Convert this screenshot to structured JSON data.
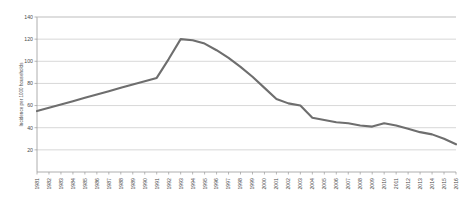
{
  "chart_data": {
    "type": "line",
    "title": "",
    "xlabel": "",
    "ylabel": "Incidence per 1000 households",
    "ylim": [
      0,
      140
    ],
    "yticks": [
      20,
      40,
      60,
      80,
      100,
      120,
      140
    ],
    "xlim": [
      1981,
      2016
    ],
    "grid": "horizontal",
    "legend": "none",
    "line_color": "#6e6e6e",
    "gridline_color": "#c6c6c6",
    "axis_color": "#9a9a9a",
    "categories": [
      "1981",
      "1982",
      "1983",
      "1984",
      "1985",
      "1986",
      "1987",
      "1988",
      "1989",
      "1990",
      "1991",
      "1992",
      "1993",
      "1994",
      "1995",
      "1996",
      "1997",
      "1998",
      "1999",
      "2000",
      "2001",
      "2002",
      "2003",
      "2004",
      "2005",
      "2006",
      "2007",
      "2008",
      "2009",
      "2010",
      "2011",
      "2012",
      "2013",
      "2014",
      "2015",
      "2016"
    ],
    "values": [
      55,
      58,
      61,
      64,
      67,
      70,
      73,
      76,
      79,
      82,
      85,
      102,
      120,
      119,
      116,
      110,
      103,
      95,
      86,
      76,
      66,
      62,
      60,
      49,
      47,
      45,
      44,
      42,
      41,
      44,
      42,
      39,
      36,
      34,
      30,
      25
    ],
    "series_name": "Incidence per 1000 households"
  }
}
